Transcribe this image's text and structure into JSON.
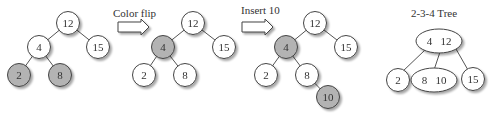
{
  "colors": {
    "red_node": "#b3b3b3",
    "black_node": "#ffffff",
    "stroke": "#444444",
    "edge": "#555555",
    "text": "#333333",
    "shadow": "#cfcfcf"
  },
  "steps": [
    {
      "id": "initial",
      "arrow_label": "",
      "nodes": [
        {
          "key": "12",
          "x": 68,
          "y": 23,
          "red": false
        },
        {
          "key": "4",
          "x": 39,
          "y": 47,
          "red": false
        },
        {
          "key": "15",
          "x": 98,
          "y": 47,
          "red": false
        },
        {
          "key": "2",
          "x": 19,
          "y": 75,
          "red": true
        },
        {
          "key": "8",
          "x": 60,
          "y": 75,
          "red": true
        }
      ]
    },
    {
      "id": "after-color-flip",
      "arrow_label": "Color flip",
      "nodes": [
        {
          "key": "12",
          "x": 193,
          "y": 23,
          "red": false
        },
        {
          "key": "4",
          "x": 163,
          "y": 47,
          "red": true
        },
        {
          "key": "15",
          "x": 224,
          "y": 47,
          "red": false
        },
        {
          "key": "2",
          "x": 144,
          "y": 75,
          "red": false
        },
        {
          "key": "8",
          "x": 185,
          "y": 75,
          "red": false
        }
      ]
    },
    {
      "id": "after-insert-10",
      "arrow_label": "Insert 10",
      "nodes": [
        {
          "key": "12",
          "x": 315,
          "y": 23,
          "red": false
        },
        {
          "key": "4",
          "x": 286,
          "y": 47,
          "red": true
        },
        {
          "key": "15",
          "x": 346,
          "y": 47,
          "red": false
        },
        {
          "key": "2",
          "x": 266,
          "y": 75,
          "red": false
        },
        {
          "key": "8",
          "x": 307,
          "y": 75,
          "red": false
        },
        {
          "key": "10",
          "x": 328,
          "y": 97,
          "red": true
        }
      ]
    }
  ],
  "tree234": {
    "title": "2-3-4 Tree",
    "root": {
      "keys": [
        "4",
        "12"
      ],
      "label": "4   12"
    },
    "children": [
      {
        "keys": [
          "2"
        ],
        "label": "2"
      },
      {
        "keys": [
          "8",
          "10"
        ],
        "label": "8   10"
      },
      {
        "keys": [
          "15"
        ],
        "label": "15"
      }
    ]
  },
  "labels": {
    "color_flip": "Color flip",
    "insert_10": "Insert 10",
    "t_12a": "12",
    "t_4a": "4",
    "t_15a": "15",
    "t_2a": "2",
    "t_8a": "8",
    "t_12b": "12",
    "t_4b": "4",
    "t_15b": "15",
    "t_2b": "2",
    "t_8b": "8",
    "t_12c": "12",
    "t_4c": "4",
    "t_15c": "15",
    "t_2c": "2",
    "t_8c": "8",
    "t_10c": "10",
    "tree_title": "2-3-4 Tree",
    "tree_root": "4   12",
    "tree_c1": "2",
    "tree_c2": "8   10",
    "tree_c3": "15"
  }
}
